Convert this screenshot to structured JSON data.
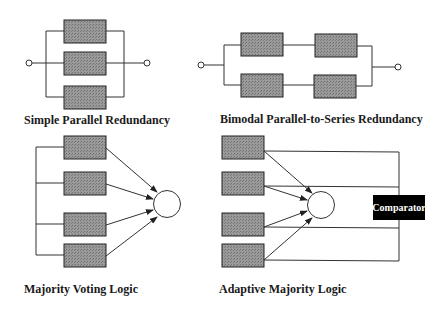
{
  "diagrams": {
    "simple_parallel": {
      "title": "Simple Parallel Redundancy",
      "module_count": 3
    },
    "bimodal": {
      "title": "Bimodal Parallel-to-Series Redundancy",
      "module_count": 4
    },
    "majority_voting": {
      "title": "Majority Voting Logic",
      "module_count": 4
    },
    "adaptive_majority": {
      "title": "Adaptive Majority Logic",
      "module_count": 4,
      "comparator_label": "Comparator"
    }
  },
  "colors": {
    "module_fill": "#8c8c8c",
    "line": "#333333",
    "comparator_bg": "#000000",
    "comparator_text": "#ffffff"
  }
}
